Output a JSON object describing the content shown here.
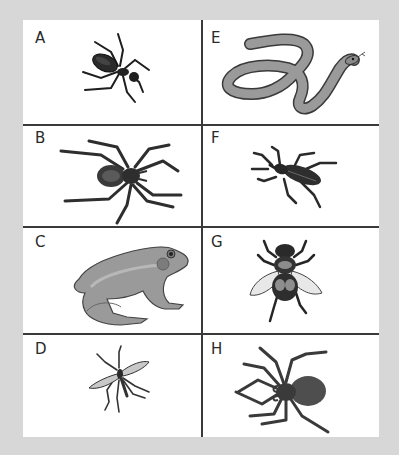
{
  "figure": {
    "background_color": "#d7d7d7",
    "panel_color": "#ffffff",
    "line_color": "#3a3a3a"
  },
  "cells": [
    {
      "label": "A",
      "animal": "ant",
      "column": "left",
      "row": 1
    },
    {
      "label": "B",
      "animal": "spider",
      "column": "left",
      "row": 2
    },
    {
      "label": "C",
      "animal": "frog",
      "column": "left",
      "row": 3
    },
    {
      "label": "D",
      "animal": "mosquito",
      "column": "left",
      "row": 4
    },
    {
      "label": "E",
      "animal": "snake",
      "column": "right",
      "row": 1
    },
    {
      "label": "F",
      "animal": "beetle",
      "column": "right",
      "row": 2
    },
    {
      "label": "G",
      "animal": "fly",
      "column": "right",
      "row": 3
    },
    {
      "label": "H",
      "animal": "spider",
      "column": "right",
      "row": 4
    }
  ]
}
